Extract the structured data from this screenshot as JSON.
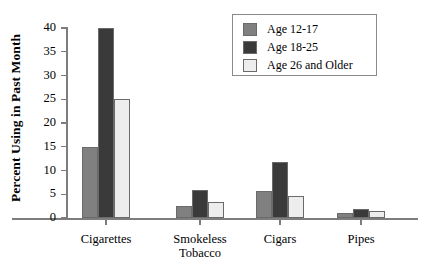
{
  "chart_data": {
    "type": "bar",
    "title": "",
    "subtitle": "",
    "xlabel": "",
    "ylabel": "Percent Using in Past Month",
    "ylim": [
      0,
      40
    ],
    "ytick_labels": [
      "0",
      "5",
      "10",
      "15",
      "20",
      "25",
      "30",
      "35",
      "40"
    ],
    "ytick_values": [
      0,
      5,
      10,
      15,
      20,
      25,
      30,
      35,
      40
    ],
    "grid": false,
    "legend_position": "top-right",
    "categories": [
      "Cigarettes",
      "Smokeless\nTobacco",
      "Cigars",
      "Pipes"
    ],
    "series": [
      {
        "name": "Age 12-17",
        "color": "#808080",
        "values": [
          14.9,
          2.5,
          5.7,
          1.0
        ]
      },
      {
        "name": "Age 18-25",
        "color": "#3a3a3a",
        "values": [
          39.9,
          5.9,
          11.8,
          1.8
        ]
      },
      {
        "name": "Age 26 and Older",
        "color": "#ededed",
        "values": [
          25.0,
          3.4,
          4.7,
          1.5
        ]
      }
    ]
  },
  "legend": {
    "items": [
      {
        "label": "Age 12-17",
        "color": "#808080"
      },
      {
        "label": "Age 18-25",
        "color": "#3a3a3a"
      },
      {
        "label": "Age 26 and Older",
        "color": "#ededed"
      }
    ]
  },
  "axis": {
    "y_title": "Percent Using in Past Month",
    "y_ticks": [
      "0",
      "5",
      "10",
      "15",
      "20",
      "25",
      "30",
      "35",
      "40"
    ],
    "x_categories": [
      "Cigarettes",
      "Smokeless\nTobacco",
      "Cigars",
      "Pipes"
    ]
  },
  "colors": {
    "axis_line": "#7d7d7d",
    "bar_border": "#6a6a6a",
    "background": "#ffffff",
    "text": "#000000"
  }
}
